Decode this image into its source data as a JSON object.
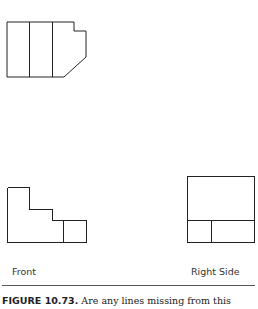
{
  "figure": {
    "views": [
      {
        "name": "Top",
        "label": ""
      },
      {
        "name": "Front",
        "label": "Front"
      },
      {
        "name": "Right Side",
        "label": "Right Side"
      }
    ],
    "caption": {
      "number": "FIGURE 10.73.",
      "text": " Are any lines missing from this"
    }
  }
}
